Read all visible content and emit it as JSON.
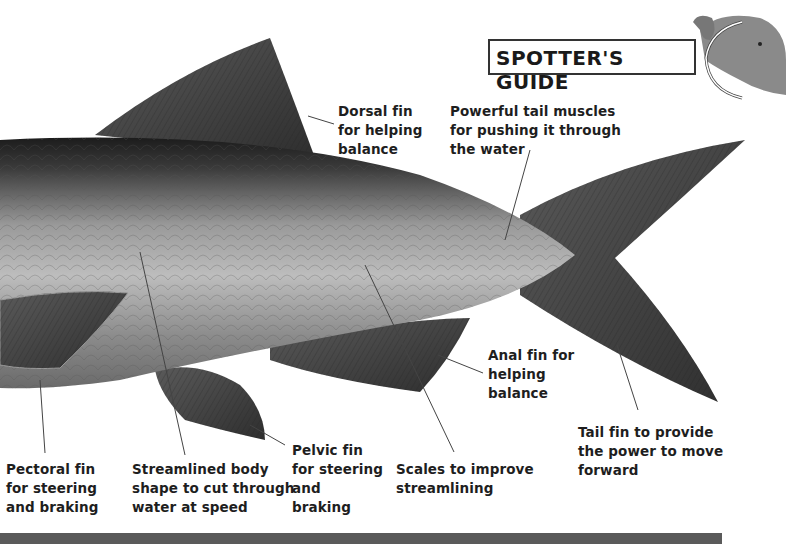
{
  "header": {
    "badge_title": "SPOTTER'S GUIDE",
    "mascot_icon": "mammoth-icon"
  },
  "diagram": {
    "labels": [
      {
        "id": "dorsal-fin",
        "text": "Dorsal fin\nfor helping\nbalance"
      },
      {
        "id": "tail-muscles",
        "text": "Powerful tail muscles\nfor pushing it through\nthe water"
      },
      {
        "id": "anal-fin",
        "text": "Anal fin for\nhelping\nbalance"
      },
      {
        "id": "tail-fin",
        "text": "Tail fin to provide\nthe power to move\nforward"
      },
      {
        "id": "pectoral-fin",
        "text": "Pectoral fin\nfor steering\nand braking"
      },
      {
        "id": "streamlined-body",
        "text": "Streamlined body\nshape to cut through\nwater at speed"
      },
      {
        "id": "pelvic-fin",
        "text": "Pelvic fin\nfor steering\nand\nbraking"
      },
      {
        "id": "scales",
        "text": "Scales to improve\nstreamlining"
      }
    ]
  },
  "colors": {
    "body_dark": "#2a2a2a",
    "body_mid": "#7a7a7a",
    "body_light": "#b8b8b8",
    "fin": "#4a4a4a",
    "text": "#1e1e1e",
    "bar": "#5a5a5a"
  }
}
